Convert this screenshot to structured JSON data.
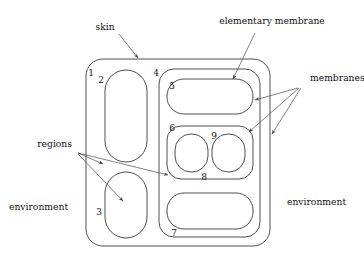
{
  "figure": {
    "stroke_color": "#3a3a3a",
    "leader_color": "#4a4a4a",
    "background": "#ffffff"
  },
  "labels": {
    "skin": "skin",
    "elementary_membrane": "elementary membrane",
    "membranes": "membranes",
    "regions": "regions",
    "environment_left": "environment",
    "environment_right": "environment"
  },
  "region_numbers": {
    "n1": "1",
    "n2": "2",
    "n3": "3",
    "n4": "4",
    "n5": "5",
    "n6": "6",
    "n7": "7",
    "n8": "8",
    "n9": "9"
  },
  "structure": {
    "skin_membrane": "1",
    "nested": [
      {
        "id": "2",
        "parent": "1",
        "kind": "elementary"
      },
      {
        "id": "3",
        "parent": "1",
        "kind": "elementary"
      },
      {
        "id": "4",
        "parent": "1",
        "kind": "composite"
      },
      {
        "id": "5",
        "parent": "4",
        "kind": "elementary"
      },
      {
        "id": "6",
        "parent": "4",
        "kind": "composite"
      },
      {
        "id": "8",
        "parent": "6",
        "kind": "elementary"
      },
      {
        "id": "9",
        "parent": "6",
        "kind": "elementary"
      },
      {
        "id": "7",
        "parent": "4",
        "kind": "elementary"
      }
    ]
  }
}
